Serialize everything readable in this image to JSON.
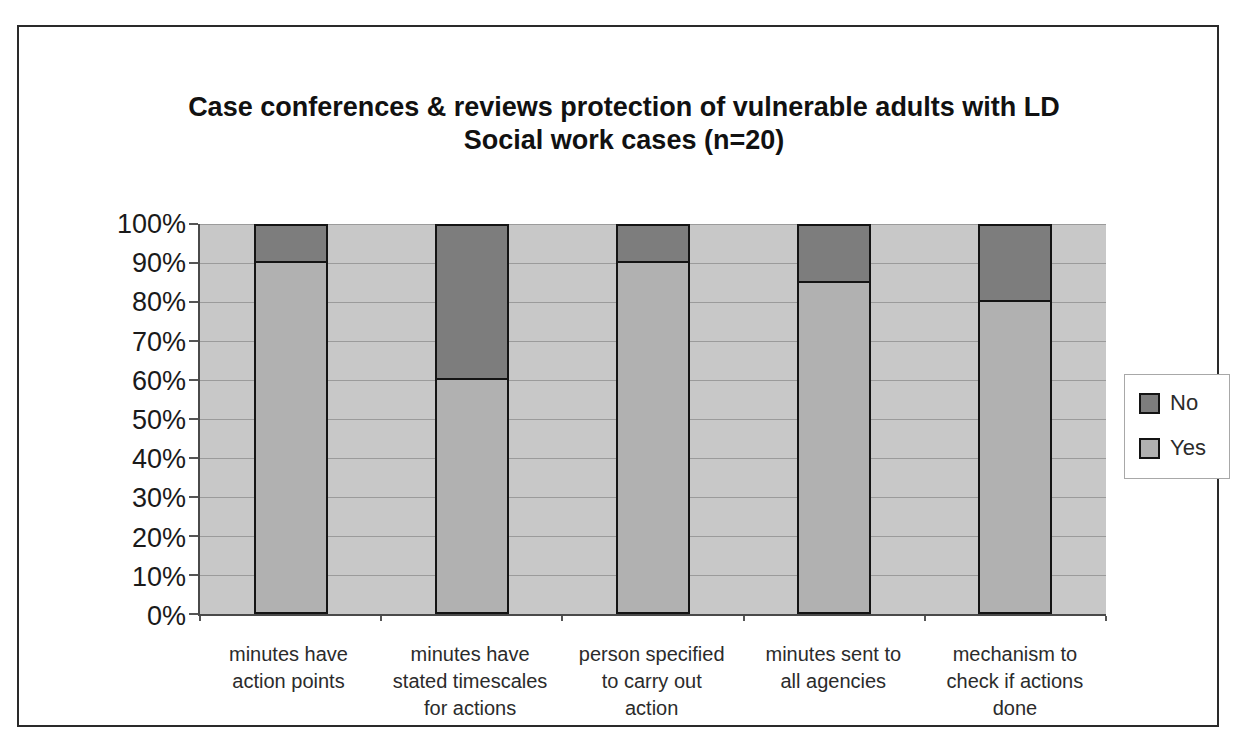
{
  "title": {
    "line1": "Case conferences & reviews protection of vulnerable adults with LD",
    "line2": "Social work cases (n=20)"
  },
  "chart_data": {
    "type": "bar",
    "stacked": true,
    "percent_scale": true,
    "title": "Case conferences & reviews protection of vulnerable adults with LD",
    "subtitle": "Social work cases (n=20)",
    "n": 20,
    "categories": [
      [
        "minutes have",
        "action points"
      ],
      [
        "minutes have",
        "stated timescales",
        "for actions"
      ],
      [
        "person specified",
        "to carry out",
        "action"
      ],
      [
        "minutes sent to",
        "all agencies"
      ],
      [
        "mechanism to",
        "check if actions",
        "done"
      ]
    ],
    "series": [
      {
        "name": "Yes",
        "color": "#b1b1b1",
        "values": [
          90,
          60,
          90,
          85,
          80
        ]
      },
      {
        "name": "No",
        "color": "#7d7d7d",
        "values": [
          10,
          40,
          10,
          15,
          20
        ]
      }
    ],
    "y_ticks": [
      "100%",
      "90%",
      "80%",
      "70%",
      "60%",
      "50%",
      "40%",
      "30%",
      "20%",
      "10%",
      "0%"
    ],
    "ylim": [
      0,
      100
    ],
    "grid": true,
    "gridline_color": "#9b9b9b",
    "plot_bg": "#c8c8c8",
    "legend_position": "right"
  },
  "legend": {
    "items": [
      {
        "label": "No",
        "color": "#7d7d7d"
      },
      {
        "label": "Yes",
        "color": "#b1b1b1"
      }
    ]
  }
}
